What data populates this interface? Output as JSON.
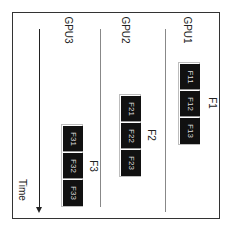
{
  "diagram": {
    "type": "gpu-timeline",
    "orientation": "rotated-90",
    "axis": {
      "label": "Time",
      "direction": "downward-arrow"
    },
    "lanes": [
      {
        "label": "GPU1"
      },
      {
        "label": "GPU2"
      },
      {
        "label": "GPU3"
      }
    ],
    "groups": [
      {
        "label": "F1",
        "lane": "GPU1",
        "cells": [
          {
            "label": "F11"
          },
          {
            "label": "F12"
          },
          {
            "label": "F13"
          }
        ]
      },
      {
        "label": "F2",
        "lane": "GPU2",
        "cells": [
          {
            "label": "F21"
          },
          {
            "label": "F22"
          },
          {
            "label": "F23"
          }
        ]
      },
      {
        "label": "F3",
        "lane": "GPU3",
        "cells": [
          {
            "label": "F31"
          },
          {
            "label": "F32"
          },
          {
            "label": "F33"
          }
        ]
      }
    ],
    "colors": {
      "cell_fill": "#111111",
      "cell_text": "#dddddd",
      "border": "#333333",
      "lane_divider": "#888888"
    }
  }
}
